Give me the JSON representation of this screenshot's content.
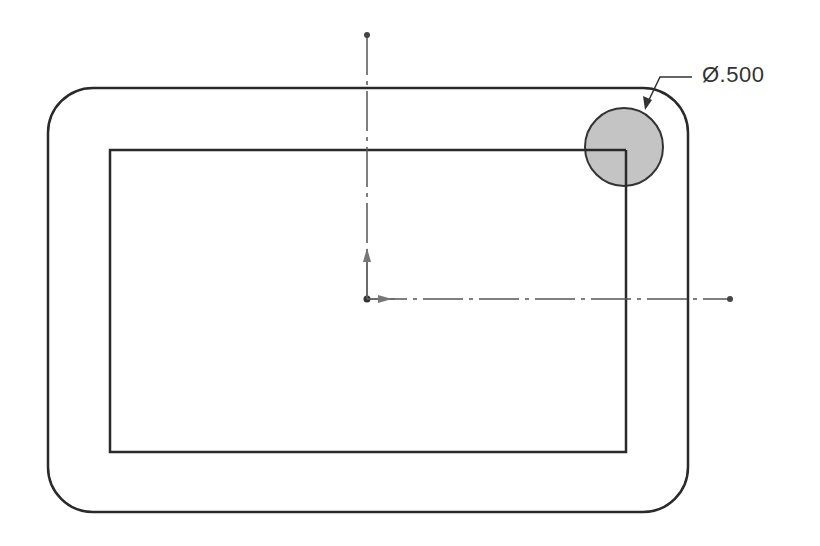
{
  "drawing": {
    "dimension_label": "Ø.500",
    "colors": {
      "line": "#2a2a2a",
      "axis": "#555555",
      "hole_fill": "#c4c4c4",
      "background": "#ffffff"
    },
    "outer_profile": {
      "x": 48,
      "y": 88,
      "width": 640,
      "height": 424,
      "corner_radius": 45
    },
    "inner_rectangle": {
      "x": 110,
      "y": 150,
      "width": 516,
      "height": 302
    },
    "hole": {
      "cx": 624,
      "cy": 147,
      "r": 39
    },
    "origin": {
      "x": 367,
      "y": 299
    },
    "vertical_axis": {
      "x": 367,
      "y_top": 35,
      "y_bottom": 299
    },
    "horizontal_axis": {
      "y": 299,
      "x_left": 367,
      "x_right": 730
    }
  }
}
